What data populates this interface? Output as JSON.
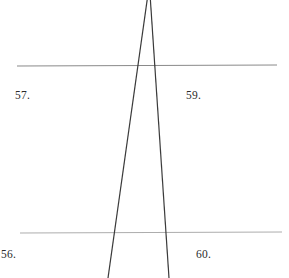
{
  "figure": {
    "width": 289,
    "height": 278,
    "background_color": "#ffffff",
    "labels": [
      {
        "id": "label-57",
        "text": "57.",
        "x": 15,
        "y": 90,
        "color": "#2b2b2b"
      },
      {
        "id": "label-59",
        "text": "59.",
        "x": 186,
        "y": 90,
        "color": "#2b2b2b"
      },
      {
        "id": "label-56",
        "text": "56.",
        "x": 1,
        "y": 249,
        "color": "#2b2b2b"
      },
      {
        "id": "label-60",
        "text": "60.",
        "x": 196,
        "y": 249,
        "color": "#2b2b2b"
      }
    ],
    "horizontal_lines": [
      {
        "id": "upper-horizontal-line",
        "x1": 17,
        "y1": 66,
        "x2": 277,
        "y2": 65,
        "color": "#8a8a8a",
        "width": 1.1
      },
      {
        "id": "lower-horizontal-line",
        "x1": 20,
        "y1": 233,
        "x2": 282,
        "y2": 232,
        "color": "#adadad",
        "width": 1.1
      }
    ],
    "oblique_lines": [
      {
        "id": "left-oblique-line",
        "x1": 148,
        "y1": -6,
        "x2": 108,
        "y2": 278,
        "color": "#3a3a3a",
        "width": 1.2
      },
      {
        "id": "right-oblique-line",
        "x1": 150,
        "y1": -6,
        "x2": 169,
        "y2": 278,
        "color": "#3a3a3a",
        "width": 1.2
      }
    ]
  }
}
